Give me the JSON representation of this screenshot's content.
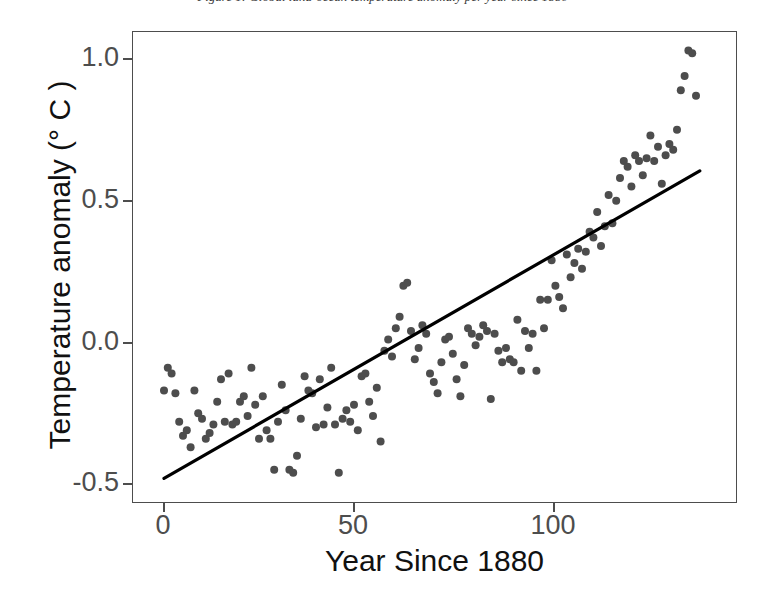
{
  "caption": {
    "text": "Figure 1: Global land-ocean temperature anomaly per year since 1880"
  },
  "chart_data": {
    "type": "scatter",
    "title": "",
    "xlabel": "Year Since 1880",
    "ylabel": "Temperature anomaly (° C )",
    "xlim": [
      -4,
      145
    ],
    "ylim": [
      -0.58,
      1.12
    ],
    "xticks": [
      0,
      50,
      100
    ],
    "xtick_labels": [
      "0",
      "50",
      "100"
    ],
    "yticks": [
      -0.5,
      0.0,
      0.5,
      1.0
    ],
    "ytick_labels": [
      "-0.5",
      "0.0",
      "0.5",
      "1.0"
    ],
    "grid": false,
    "legend": "none",
    "point_color": "#4d4d4d",
    "point_size_px": 8,
    "line_color": "#000000",
    "frame_color": "#4d4d4d",
    "background": "#ffffff",
    "trend_line": {
      "label": "linear fit",
      "x": [
        0,
        141
      ],
      "y": [
        -0.48,
        0.605
      ]
    },
    "x": [
      0,
      1,
      2,
      3,
      4,
      5,
      6,
      7,
      8,
      9,
      10,
      11,
      12,
      13,
      14,
      15,
      16,
      17,
      18,
      19,
      20,
      21,
      22,
      23,
      24,
      25,
      26,
      27,
      28,
      29,
      30,
      31,
      32,
      33,
      34,
      35,
      36,
      37,
      38,
      39,
      40,
      41,
      42,
      43,
      44,
      45,
      46,
      47,
      48,
      49,
      50,
      51,
      52,
      53,
      54,
      55,
      56,
      57,
      58,
      59,
      60,
      61,
      62,
      63,
      64,
      65,
      66,
      67,
      68,
      69,
      70,
      71,
      72,
      73,
      74,
      75,
      76,
      77,
      78,
      79,
      80,
      81,
      82,
      83,
      84,
      85,
      86,
      87,
      88,
      89,
      90,
      91,
      92,
      93,
      94,
      95,
      96,
      97,
      98,
      99,
      100,
      101,
      102,
      103,
      104,
      105,
      106,
      107,
      108,
      109,
      110,
      111,
      112,
      113,
      114,
      115,
      116,
      117,
      118,
      119,
      120,
      121,
      122,
      123,
      124,
      125,
      126,
      127,
      128,
      129,
      130,
      131,
      132,
      133,
      134,
      135,
      136,
      137,
      138,
      139,
      140
    ],
    "y": [
      -0.17,
      -0.09,
      -0.11,
      -0.18,
      -0.28,
      -0.33,
      -0.31,
      -0.37,
      -0.17,
      -0.25,
      -0.27,
      -0.34,
      -0.32,
      -0.29,
      -0.21,
      -0.13,
      -0.28,
      -0.11,
      -0.29,
      -0.28,
      -0.21,
      -0.19,
      -0.26,
      -0.09,
      -0.22,
      -0.34,
      -0.19,
      -0.31,
      -0.34,
      -0.45,
      -0.28,
      -0.15,
      -0.24,
      -0.45,
      -0.46,
      -0.4,
      -0.27,
      -0.12,
      -0.17,
      -0.18,
      -0.3,
      -0.13,
      -0.29,
      -0.23,
      -0.09,
      -0.29,
      -0.46,
      -0.27,
      -0.24,
      -0.28,
      -0.22,
      -0.31,
      -0.12,
      -0.11,
      -0.21,
      -0.26,
      -0.16,
      -0.35,
      -0.03,
      0.01,
      -0.05,
      0.05,
      0.09,
      0.2,
      0.21,
      0.04,
      -0.06,
      -0.02,
      0.06,
      0.03,
      -0.11,
      -0.14,
      -0.18,
      -0.07,
      0.01,
      0.02,
      -0.04,
      -0.13,
      -0.19,
      -0.08,
      0.05,
      0.03,
      -0.01,
      0.02,
      0.06,
      0.04,
      -0.2,
      0.03,
      -0.03,
      -0.07,
      -0.02,
      -0.06,
      -0.07,
      0.08,
      -0.1,
      0.04,
      -0.02,
      0.03,
      -0.1,
      0.15,
      0.05,
      0.15,
      0.29,
      0.2,
      0.16,
      0.12,
      0.31,
      0.23,
      0.28,
      0.33,
      0.26,
      0.32,
      0.39,
      0.37,
      0.46,
      0.34,
      0.41,
      0.52,
      0.42,
      0.5,
      0.58,
      0.64,
      0.62,
      0.55,
      0.66,
      0.64,
      0.59,
      0.65,
      0.73,
      0.64,
      0.69,
      0.56,
      0.66,
      0.7,
      0.68,
      0.75,
      0.89,
      0.94,
      1.03,
      1.02,
      0.87,
      0.85
    ]
  }
}
